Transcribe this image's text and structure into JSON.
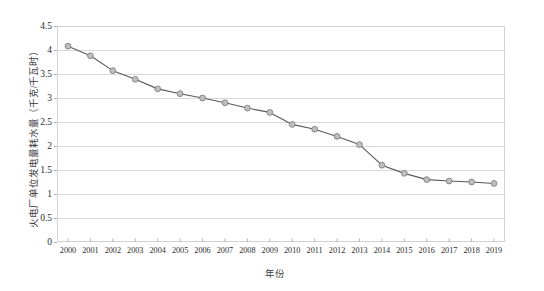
{
  "chart_data": {
    "type": "line",
    "title": "",
    "xlabel": "年份",
    "ylabel": "火电厂单位发电量耗水量（千克/千瓦时）",
    "categories": [
      "2000",
      "2001",
      "2002",
      "2003",
      "2004",
      "2005",
      "2006",
      "2007",
      "2008",
      "2009",
      "2010",
      "2011",
      "2012",
      "2013",
      "2014",
      "2015",
      "2016",
      "2017",
      "2018",
      "2019"
    ],
    "values": [
      4.08,
      3.88,
      3.57,
      3.39,
      3.19,
      3.09,
      3.0,
      2.9,
      2.79,
      2.7,
      2.45,
      2.35,
      2.2,
      2.03,
      1.6,
      1.43,
      1.3,
      1.27,
      1.25,
      1.22
    ],
    "series": [
      {
        "name": "火电厂单位发电量耗水量",
        "values": [
          4.08,
          3.88,
          3.57,
          3.39,
          3.19,
          3.09,
          3.0,
          2.9,
          2.79,
          2.7,
          2.45,
          2.35,
          2.2,
          2.03,
          1.6,
          1.43,
          1.3,
          1.27,
          1.25,
          1.22
        ]
      }
    ],
    "ylim": [
      0,
      4.5
    ],
    "yticks": [
      "0",
      "0.5",
      "1",
      "1.5",
      "2",
      "2.5",
      "3",
      "3.5",
      "4",
      "4.5"
    ],
    "ytick_values": [
      0,
      0.5,
      1,
      1.5,
      2,
      2.5,
      3,
      3.5,
      4,
      4.5
    ],
    "grid": true,
    "grid_axis": "y",
    "legend": false,
    "legend_position": "none",
    "marker": "circle",
    "colors": {
      "line": "#595959",
      "marker_fill": "#bfbfbf",
      "marker_edge": "#808080",
      "grid": "#d9d9d9",
      "axis": "#bfbfbf",
      "text": "#2b2b2b",
      "background": "#ffffff"
    }
  }
}
